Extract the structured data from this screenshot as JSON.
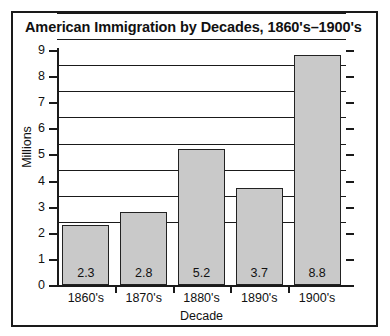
{
  "chart_data": {
    "type": "bar",
    "title": "American Immigration by Decades, 1860's–1900's",
    "xlabel": "Decade",
    "ylabel": "Millions",
    "categories": [
      "1860's",
      "1870's",
      "1880's",
      "1890's",
      "1900's"
    ],
    "values": [
      2.3,
      2.8,
      5.2,
      3.7,
      8.8
    ],
    "value_labels": [
      "2.3",
      "2.8",
      "5.2",
      "3.7",
      "8.8"
    ],
    "ylim": [
      0,
      9
    ],
    "yticks": [
      0,
      1,
      2,
      3,
      4,
      5,
      6,
      7,
      8,
      9
    ],
    "ytick_labels": [
      "0",
      "1",
      "2",
      "3",
      "4",
      "5",
      "6",
      "7",
      "8",
      "9"
    ],
    "grid": true,
    "grid_axis": "y",
    "legend": null,
    "bar_color": "#c9c9c9",
    "bar_border_color": "#222222",
    "axis_color": "#1a1a1a",
    "background_color": "#ffffff"
  }
}
